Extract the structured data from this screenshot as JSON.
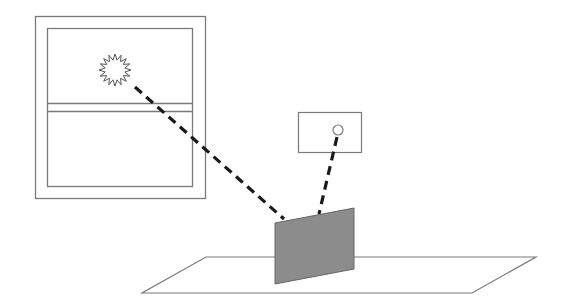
{
  "diagram": {
    "elements": {
      "window": {
        "label": "",
        "icon": "window-icon"
      },
      "sun": {
        "label": "",
        "icon": "sun-icon"
      },
      "lamp_box": {
        "label": "",
        "icon": "lamp-icon"
      },
      "panel": {
        "label": "",
        "icon": "panel-icon",
        "fill": "#8c8c8c"
      },
      "floor": {
        "label": "",
        "icon": "floor-plane-icon"
      },
      "ray_sun_to_panel": {
        "style": "dashed"
      },
      "ray_lamp_to_panel": {
        "style": "dashed"
      }
    },
    "colors": {
      "stroke": "#7a7a7a",
      "ray": "#1a1a1a",
      "panel_fill": "#8c8c8c",
      "background": "#ffffff"
    }
  }
}
